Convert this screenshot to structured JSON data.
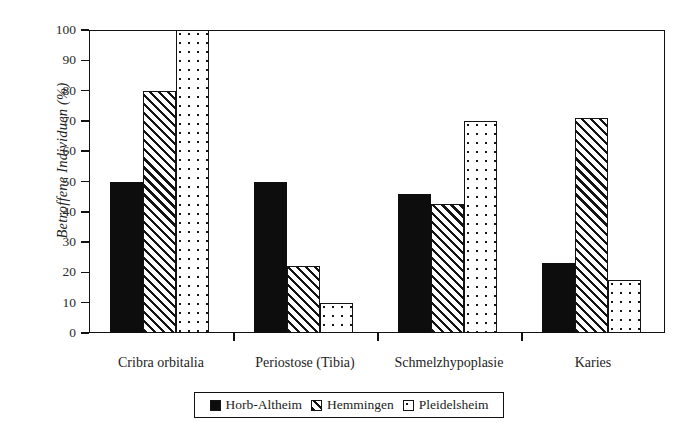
{
  "chart_data": {
    "type": "bar",
    "title": "",
    "xlabel": "",
    "ylabel": "Betroffene Individuen (%)",
    "ylim": [
      0,
      100
    ],
    "ytick_values": [
      0,
      10,
      20,
      30,
      40,
      50,
      60,
      70,
      80,
      90,
      100
    ],
    "ytick_labels": [
      "0",
      "10",
      "20",
      "30",
      "40",
      "50",
      "60",
      "70",
      "80",
      "90",
      "100"
    ],
    "grid": false,
    "legend_position": "bottom-center",
    "categories": [
      "Cribra orbitalia",
      "Periostose (Tibia)",
      "Schmelzhypoplasie",
      "Karies"
    ],
    "series": [
      {
        "name": "Horb-Altheim",
        "pattern": "solid",
        "color": "#0d0d0d",
        "values": [
          50,
          50,
          46,
          23
        ]
      },
      {
        "name": "Hemmingen",
        "pattern": "diagonal-hatch",
        "color": "#ffffff",
        "values": [
          80,
          22,
          42.5,
          71
        ]
      },
      {
        "name": "Pleidelsheim",
        "pattern": "dotted",
        "color": "#ffffff",
        "values": [
          100,
          10,
          70,
          17.5
        ]
      }
    ]
  },
  "legend": {
    "items": [
      {
        "label": "Horb-Altheim",
        "pattern": "solid"
      },
      {
        "label": "Hemmingen",
        "pattern": "diagonal-hatch"
      },
      {
        "label": "Pleidelsheim",
        "pattern": "dotted"
      }
    ]
  }
}
